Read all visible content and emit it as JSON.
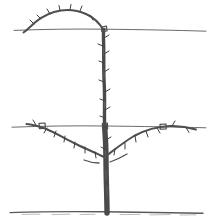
{
  "figure": {
    "background_color": "#ffffff",
    "ink_color": "#4a4a4a",
    "wire_color": "#6b6b6b",
    "ground_color": "#5a5a5a",
    "width": 212,
    "height": 222
  },
  "support_wires": [
    {
      "name": "top-wire",
      "label": "Top training wire",
      "y": 29,
      "x_start": 14,
      "x_end": 206,
      "color": "#6b6b6b"
    },
    {
      "name": "lower-wire",
      "label": "Lower training wire",
      "y": 126,
      "x_start": 12,
      "x_end": 206,
      "color": "#6b6b6b"
    }
  ],
  "ground_line": {
    "name": "ground-line",
    "label": "Soil surface",
    "y": 212,
    "x_start": 10,
    "x_end": 203,
    "color": "#5a5a5a"
  },
  "trunk": {
    "name": "central-trunk",
    "label": "Central leader trunk",
    "base_x": 107,
    "base_y": 212,
    "top_x": 104,
    "top_y": 29,
    "width_base": 6,
    "width_top": 3,
    "color": "#4a4a4a",
    "path": "M 107 213 C 107 196 106 178 106 160 C 106 142 105 132 104.5 126 C 104 112 105 98 104 84 C 103 70 104 54 103.5 42 C 103.2 35 103.5 31 104 29"
  },
  "branches": [
    {
      "name": "arched-leader",
      "label": "Arched leader trained over top wire",
      "side": "top-left-arch",
      "color": "#4f4f4f",
      "stroke_width": 2,
      "tip_x": 24,
      "tip_y": 32,
      "apex_x": 62,
      "apex_y": 12,
      "origin_x": 104,
      "origin_y": 29,
      "path": "M 103.5 30 C 100 24 95 18 86 14 C 76 9.5 64 9 54 12 C 44 15 36 21 30 27 C 27 30 25 31.5 23.5 32.5"
    },
    {
      "name": "left-scaffold-branch",
      "label": "Left lateral scaffold branch tied to lower wire",
      "side": "left",
      "color": "#4f4f4f",
      "stroke_width": 2,
      "origin_x": 104,
      "origin_y": 157,
      "tip_x": 26,
      "tip_y": 124,
      "path": "M 104 157 C 96 153 86 149 76 144 C 64 138 54 132 45 128.5 C 38 126 32 124.5 26.5 124"
    },
    {
      "name": "right-scaffold-branch",
      "label": "Right lateral scaffold branch tied to lower wire",
      "side": "right",
      "color": "#4f4f4f",
      "stroke_width": 2,
      "origin_x": 106,
      "origin_y": 156,
      "tip_x": 196,
      "tip_y": 130,
      "path": "M 106 156 C 114 150 124 142 134 136 C 146 129.5 158 126.5 170 126 C 180 125.6 188 127 196 129.5"
    },
    {
      "name": "left-lower-spur",
      "label": "Short spur below left scaffold",
      "side": "left",
      "color": "#4f4f4f",
      "stroke_width": 1.3,
      "path": "M 99 163 C 94 163 89 162 84 160"
    },
    {
      "name": "right-lower-spur",
      "label": "Short spur below right scaffold",
      "side": "right",
      "color": "#4f4f4f",
      "stroke_width": 1.3,
      "path": "M 110 162 C 116 160 122 157 127 154"
    }
  ],
  "tie_points": [
    {
      "name": "tie-top-wire-leader",
      "label": "Leader tied at top wire",
      "x": 104,
      "y": 29
    },
    {
      "name": "tie-top-wire-arch",
      "label": "Arch crossing top wire",
      "x": 31,
      "y": 28
    },
    {
      "name": "tie-lower-wire-trunk",
      "label": "Trunk tied at lower wire",
      "x": 105,
      "y": 126
    },
    {
      "name": "tie-lower-wire-left",
      "label": "Left branch tied at lower wire",
      "x": 42,
      "y": 126
    },
    {
      "name": "tie-lower-wire-right",
      "label": "Right branch tied at lower wire",
      "x": 163,
      "y": 126
    }
  ],
  "buds": {
    "label": "Dormant buds and fruiting spurs",
    "color": "#3f3f3f",
    "count": 34,
    "on_trunk": [
      {
        "x": 104,
        "y": 38,
        "dx": 5,
        "dy": -3
      },
      {
        "x": 103,
        "y": 46,
        "dx": -5,
        "dy": -2
      },
      {
        "x": 104,
        "y": 54,
        "dx": 5,
        "dy": -3
      },
      {
        "x": 104,
        "y": 63,
        "dx": -5,
        "dy": -2
      },
      {
        "x": 104,
        "y": 72,
        "dx": 5,
        "dy": -3
      },
      {
        "x": 104,
        "y": 82,
        "dx": -5,
        "dy": -2
      },
      {
        "x": 105,
        "y": 92,
        "dx": 5,
        "dy": -3
      },
      {
        "x": 105,
        "y": 101,
        "dx": -5,
        "dy": -2
      },
      {
        "x": 105,
        "y": 110,
        "dx": 5,
        "dy": -3
      },
      {
        "x": 105,
        "y": 118,
        "dx": -5,
        "dy": -2
      },
      {
        "x": 106,
        "y": 140,
        "dx": 5,
        "dy": -3
      },
      {
        "x": 106,
        "y": 150,
        "dx": -5,
        "dy": -3
      }
    ],
    "on_arch": [
      {
        "x": 90,
        "y": 15,
        "dx": 3,
        "dy": 5
      },
      {
        "x": 80,
        "y": 11,
        "dx": 2,
        "dy": -5
      },
      {
        "x": 70,
        "y": 9.5,
        "dx": 1,
        "dy": -5
      },
      {
        "x": 60,
        "y": 10.5,
        "dx": -1,
        "dy": -5
      },
      {
        "x": 50,
        "y": 14,
        "dx": -3,
        "dy": -5
      },
      {
        "x": 41,
        "y": 19,
        "dx": -4,
        "dy": -4
      },
      {
        "x": 34,
        "y": 24,
        "dx": -4,
        "dy": -4
      }
    ],
    "on_left_branch": [
      {
        "x": 95,
        "y": 152,
        "dx": 1,
        "dy": 6
      },
      {
        "x": 85,
        "y": 147,
        "dx": 0,
        "dy": 6
      },
      {
        "x": 75,
        "y": 142,
        "dx": -1,
        "dy": 6
      },
      {
        "x": 65,
        "y": 136,
        "dx": -1,
        "dy": 6
      },
      {
        "x": 56,
        "y": 131,
        "dx": -2,
        "dy": 6
      },
      {
        "x": 47,
        "y": 128,
        "dx": -3,
        "dy": 5
      },
      {
        "x": 36,
        "y": 125,
        "dx": -3,
        "dy": -5
      }
    ],
    "on_right_branch": [
      {
        "x": 115,
        "y": 149,
        "dx": -1,
        "dy": 6
      },
      {
        "x": 125,
        "y": 143,
        "dx": 0,
        "dy": 6
      },
      {
        "x": 135,
        "y": 136,
        "dx": 1,
        "dy": 6
      },
      {
        "x": 146,
        "y": 131,
        "dx": 2,
        "dy": 6
      },
      {
        "x": 157,
        "y": 128,
        "dx": 3,
        "dy": 5
      },
      {
        "x": 172,
        "y": 126,
        "dx": 3,
        "dy": -5
      },
      {
        "x": 186,
        "y": 127.5,
        "dx": 3,
        "dy": 5
      }
    ]
  }
}
